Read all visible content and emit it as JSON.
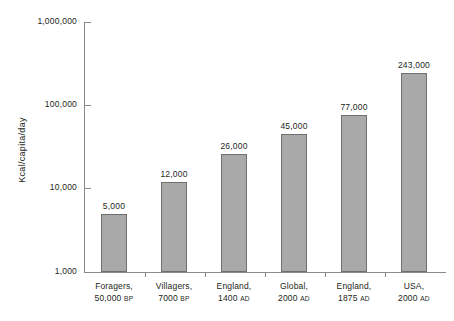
{
  "chart_data": {
    "type": "bar",
    "title": "",
    "subtitle": "",
    "xlabel": "",
    "ylabel": "Kcal/capita/day",
    "yscale": "log",
    "ylim": [
      1000,
      1000000
    ],
    "ytick_labels": [
      "1,000,000",
      "100,000",
      "10,000",
      "1,000"
    ],
    "ytick_values": [
      1000000,
      100000,
      10000,
      1000
    ],
    "grid": false,
    "legend": null,
    "categories": [
      "Foragers, 50,000 BP",
      "Villagers, 7000 BP",
      "England, 1400 AD",
      "Global, 2000 AD",
      "England, 1875 AD",
      "USA, 2000 AD"
    ],
    "category_lines": [
      {
        "line1": "Foragers,",
        "line2_number": "50,000",
        "line2_era": "BP"
      },
      {
        "line1": "Villagers,",
        "line2_number": "7000",
        "line2_era": "BP"
      },
      {
        "line1": "England,",
        "line2_number": "1400",
        "line2_era": "AD"
      },
      {
        "line1": "Global,",
        "line2_number": "2000",
        "line2_era": "AD"
      },
      {
        "line1": "England,",
        "line2_number": "1875",
        "line2_era": "AD"
      },
      {
        "line1": "USA,",
        "line2_number": "2000",
        "line2_era": "AD"
      }
    ],
    "values": [
      5000,
      12000,
      26000,
      45000,
      77000,
      243000
    ],
    "value_labels": [
      "5,000",
      "12,000",
      "26,000",
      "45,000",
      "77,000",
      "243,000"
    ],
    "bar_color": "#a9a9a9",
    "bar_edge_color": "#6f6f6f",
    "axis_color": "#8a8a8a",
    "background_color": "#ffffff"
  }
}
